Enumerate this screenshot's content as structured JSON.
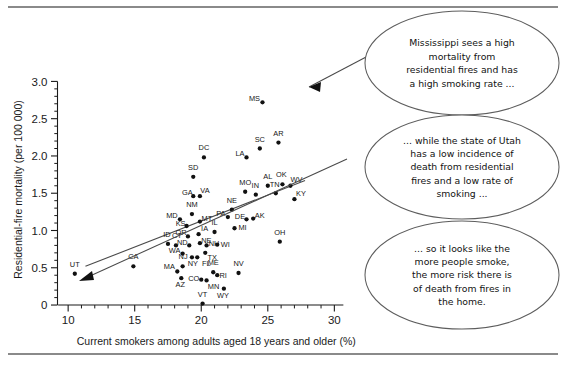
{
  "chart_data": {
    "type": "scatter",
    "title": "",
    "xlabel": "Current smokers among adults aged 18 years and older (%)",
    "ylabel": "Residential-fire mortality (per 100 000)",
    "xlim": [
      9.2,
      30.8
    ],
    "ylim": [
      -0.08,
      3.18
    ],
    "grid": false,
    "legend": null,
    "xticks": [
      10,
      15,
      20,
      25,
      30
    ],
    "xtick_labels": [
      "10",
      "15",
      "20",
      "25",
      "30"
    ],
    "xticks_minor_step": 1,
    "yticks": [
      0,
      0.5,
      1.0,
      1.5,
      2.0,
      2.5,
      3.0
    ],
    "ytick_labels": [
      "0",
      "0.5",
      "1.0",
      "1.5",
      "2.0",
      "2.5",
      "3.0"
    ],
    "yticks_minor_step": 0.1,
    "series": [
      {
        "name": "US states and DC",
        "point_label_key": "state",
        "points": [
          {
            "state": "UT",
            "x": 10.5,
            "y": 0.42
          },
          {
            "state": "CA",
            "x": 14.9,
            "y": 0.52
          },
          {
            "state": "ID",
            "x": 17.5,
            "y": 0.82
          },
          {
            "state": "CT",
            "x": 18.1,
            "y": 0.8
          },
          {
            "state": "MA",
            "x": 18.2,
            "y": 0.45
          },
          {
            "state": "NJ",
            "x": 18.6,
            "y": 0.52
          },
          {
            "state": "AZ",
            "x": 18.5,
            "y": 0.36
          },
          {
            "state": "WA",
            "x": 18.6,
            "y": 0.69
          },
          {
            "state": "MD",
            "x": 18.4,
            "y": 1.15
          },
          {
            "state": "KS",
            "x": 18.9,
            "y": 1.06
          },
          {
            "state": "OR",
            "x": 19.0,
            "y": 0.92
          },
          {
            "state": "ND",
            "x": 19.1,
            "y": 0.8
          },
          {
            "state": "NY",
            "x": 19.3,
            "y": 0.64
          },
          {
            "state": "FL",
            "x": 19.7,
            "y": 0.64
          },
          {
            "state": "NM",
            "x": 19.3,
            "y": 1.22
          },
          {
            "state": "SD",
            "x": 19.4,
            "y": 1.72
          },
          {
            "state": "GA",
            "x": 19.4,
            "y": 1.46
          },
          {
            "state": "VA",
            "x": 19.9,
            "y": 1.46
          },
          {
            "state": "MT",
            "x": 19.9,
            "y": 1.12
          },
          {
            "state": "IA",
            "x": 19.8,
            "y": 0.95
          },
          {
            "state": "NE",
            "x": 19.9,
            "y": 0.83
          },
          {
            "state": "CO",
            "x": 20.0,
            "y": 0.34
          },
          {
            "state": "MN",
            "x": 20.4,
            "y": 0.33
          },
          {
            "state": "VT",
            "x": 20.1,
            "y": 0.02
          },
          {
            "state": "DC",
            "x": 20.2,
            "y": 1.98
          },
          {
            "state": "TX",
            "x": 20.3,
            "y": 0.7
          },
          {
            "state": "NH",
            "x": 20.4,
            "y": 0.8
          },
          {
            "state": "ME",
            "x": 20.9,
            "y": 0.44
          },
          {
            "state": "RI",
            "x": 21.2,
            "y": 0.4
          },
          {
            "state": "IL",
            "x": 21.0,
            "y": 0.98
          },
          {
            "state": "WI",
            "x": 21.2,
            "y": 0.81
          },
          {
            "state": "WY",
            "x": 21.7,
            "y": 0.22
          },
          {
            "state": "PA",
            "x": 22.0,
            "y": 1.18
          },
          {
            "state": "NE2",
            "x": 22.3,
            "y": 1.28
          },
          {
            "state": "MI",
            "x": 22.5,
            "y": 1.03
          },
          {
            "state": "NV",
            "x": 22.8,
            "y": 0.43
          },
          {
            "state": "LA",
            "x": 23.4,
            "y": 1.98
          },
          {
            "state": "MO",
            "x": 23.3,
            "y": 1.52
          },
          {
            "state": "DE",
            "x": 23.4,
            "y": 1.15
          },
          {
            "state": "AK",
            "x": 23.9,
            "y": 1.16
          },
          {
            "state": "SC",
            "x": 24.4,
            "y": 2.1
          },
          {
            "state": "IN",
            "x": 24.1,
            "y": 1.48
          },
          {
            "state": "MS",
            "x": 24.6,
            "y": 2.72
          },
          {
            "state": "AL",
            "x": 25.0,
            "y": 1.6
          },
          {
            "state": "AR",
            "x": 25.8,
            "y": 2.18
          },
          {
            "state": "TN",
            "x": 25.6,
            "y": 1.5
          },
          {
            "state": "OH",
            "x": 25.9,
            "y": 0.85
          },
          {
            "state": "OK",
            "x": 26.1,
            "y": 1.62
          },
          {
            "state": "WV",
            "x": 26.7,
            "y": 1.6
          },
          {
            "state": "KY",
            "x": 27.0,
            "y": 1.42
          }
        ]
      }
    ],
    "fit_line": {
      "name": "linear trend",
      "x_start": 11.3,
      "y_start": 0.52,
      "x_end": 27.8,
      "y_end": 1.67
    }
  },
  "axes": {
    "x_title": "Current smokers among adults aged 18 years and older (%)",
    "y_title": "Residential-fire mortality (per 100 000)"
  },
  "callouts": [
    {
      "id": "callout-mississippi",
      "lines": [
        "Mississippi sees a high",
        "mortality from",
        "residential fires and has",
        "a high smoking rate ..."
      ],
      "target_state": "MS"
    },
    {
      "id": "callout-utah",
      "lines": [
        "... while the state of Utah",
        "has a low incidence of",
        "death from residential",
        "fires and a low rate of",
        "smoking ..."
      ],
      "target_state": "UT"
    },
    {
      "id": "callout-conclusion",
      "lines": [
        "... so it looks like the",
        "more people smoke,",
        "the more risk there is",
        "of death from fires in",
        "the home."
      ],
      "target_state": null
    }
  ],
  "colors": {
    "point": "#111111",
    "axis": "#1a1a1a",
    "fit_line": "#4a4a4a",
    "callout_border": "#5d5d5d",
    "rule": "#8a8a8a",
    "background": "#ffffff"
  }
}
